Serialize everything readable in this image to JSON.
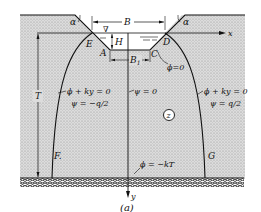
{
  "figure": {
    "caption": "(a)",
    "colors": {
      "soil": "#d9d9d9",
      "soil_dots": "#9a9a9a",
      "lines": "#111111",
      "background": "#ffffff"
    },
    "dimensions": {
      "top_width": "B",
      "bottom_width": "B",
      "bottom_width_sub": "1",
      "depth": "H",
      "layer_thickness": "T",
      "slope_angle_left": "α",
      "slope_angle_right": "α"
    },
    "points": {
      "E": "E",
      "D": "D",
      "A": "A",
      "C": "C",
      "F": "F.",
      "G": "G"
    },
    "axes": {
      "x": "x",
      "y": "y"
    },
    "water_surface_symbol": "∇",
    "region_label": "z",
    "conditions": {
      "channel_bed": "ϕ=0",
      "left_free_surface_1": "ϕ + ky = 0",
      "left_free_surface_2": "ψ = −q/2",
      "centerline": "ψ = 0",
      "right_free_surface_1": "ϕ + ky = 0",
      "right_free_surface_2": "ψ = q/2",
      "base": "ϕ = −kT"
    }
  }
}
